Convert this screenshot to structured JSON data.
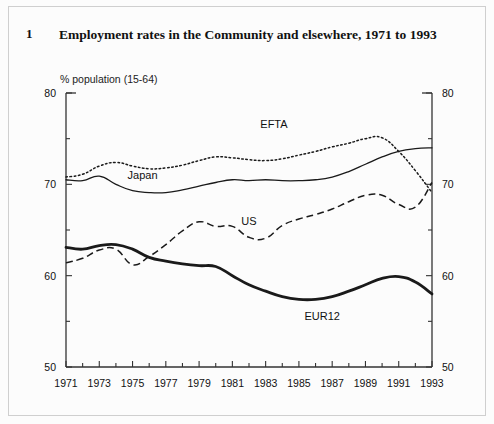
{
  "figure": {
    "number": "1",
    "title": "Employment rates in the Community and elsewhere, 1971 to 1993",
    "unit_label": "% population (15-64)"
  },
  "chart_data": {
    "type": "line",
    "title": "Employment rates in the Community and elsewhere, 1971 to 1993",
    "subtitle": "",
    "xlabel": "",
    "ylabel": "% population (15-64)",
    "ylim": [
      50,
      80
    ],
    "xlim": [
      1971,
      1993
    ],
    "y_ticks": [
      50,
      60,
      70,
      80
    ],
    "y_minor_tick_step": 5,
    "x_ticks": [
      1971,
      1972,
      1973,
      1974,
      1975,
      1976,
      1977,
      1978,
      1979,
      1980,
      1981,
      1982,
      1983,
      1984,
      1985,
      1986,
      1987,
      1988,
      1989,
      1990,
      1991,
      1992,
      1993
    ],
    "x_tick_labels": [
      "1971",
      "",
      "1973",
      "",
      "1975",
      "",
      "1977",
      "",
      "1979",
      "",
      "1981",
      "",
      "1983",
      "",
      "1985",
      "",
      "1987",
      "",
      "1989",
      "",
      "1991",
      "",
      "1993"
    ],
    "grid": false,
    "legend_position": "inline-annotations",
    "dual_y_axis": true,
    "x": [
      1971,
      1972,
      1973,
      1974,
      1975,
      1976,
      1977,
      1978,
      1979,
      1980,
      1981,
      1982,
      1983,
      1984,
      1985,
      1986,
      1987,
      1988,
      1989,
      1990,
      1991,
      1992,
      1993
    ],
    "series": [
      {
        "name": "EFTA",
        "style": "dotted",
        "label": "EFTA",
        "values": [
          70.8,
          71.1,
          72.0,
          72.4,
          72.0,
          71.7,
          71.8,
          72.1,
          72.6,
          73.0,
          72.9,
          72.7,
          72.6,
          72.8,
          73.2,
          73.6,
          74.1,
          74.5,
          75.0,
          75.1,
          73.6,
          71.5,
          69.1
        ]
      },
      {
        "name": "Japan",
        "style": "solid-thin",
        "label": "Japan",
        "values": [
          70.5,
          70.4,
          70.9,
          70.0,
          69.3,
          69.1,
          69.1,
          69.4,
          69.8,
          70.2,
          70.5,
          70.4,
          70.5,
          70.4,
          70.4,
          70.5,
          70.8,
          71.4,
          72.2,
          73.0,
          73.6,
          73.9,
          74.0
        ]
      },
      {
        "name": "US",
        "style": "dashed",
        "label": "US",
        "values": [
          61.4,
          61.9,
          62.8,
          62.9,
          61.2,
          62.1,
          63.4,
          64.9,
          65.9,
          65.4,
          65.4,
          64.2,
          64.1,
          65.5,
          66.2,
          66.7,
          67.3,
          68.1,
          68.8,
          68.8,
          67.8,
          67.5,
          70.2
        ]
      },
      {
        "name": "EUR12",
        "style": "solid-thick",
        "label": "EUR12",
        "values": [
          63.1,
          62.9,
          63.3,
          63.4,
          62.9,
          62.0,
          61.6,
          61.3,
          61.1,
          61.0,
          60.0,
          59.0,
          58.3,
          57.7,
          57.4,
          57.4,
          57.7,
          58.3,
          59.0,
          59.7,
          59.9,
          59.3,
          58.0
        ]
      }
    ]
  },
  "axis": {
    "left_labels": [
      "80",
      "70",
      "60",
      "50"
    ],
    "right_labels": [
      "80",
      "70",
      "60",
      "50"
    ],
    "x_labels": [
      "1971",
      "1973",
      "1975",
      "1977",
      "1979",
      "1981",
      "1983",
      "1985",
      "1987",
      "1989",
      "1991",
      "1993"
    ]
  },
  "annotations": [
    {
      "text": "EFTA",
      "x": 1983.5,
      "y": 76.2
    },
    {
      "text": "Japan",
      "x": 1975.6,
      "y": 70.6
    },
    {
      "text": "US",
      "x": 1982.0,
      "y": 65.6
    },
    {
      "text": "EUR12",
      "x": 1986.4,
      "y": 55.1
    }
  ],
  "colors": {
    "line": "#1a1a1a",
    "axis": "#333333",
    "background": "#fcfcfc",
    "border": "#cfcfcf",
    "text": "#111111"
  }
}
